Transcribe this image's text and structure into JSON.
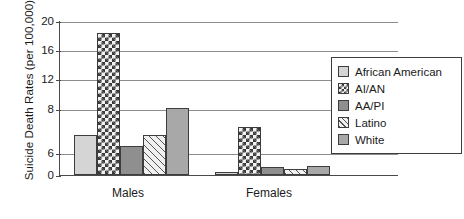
{
  "chart_data": {
    "type": "bar",
    "title": "",
    "xlabel": "",
    "ylabel": "Suicide Death Rates (per 100,000)",
    "categories": [
      "Males",
      "Females"
    ],
    "series": [
      {
        "name": "African American",
        "values": [
          6.8,
          0.8
        ],
        "pattern": "solid-light-gray",
        "color": "#d5d5d5"
      },
      {
        "name": "AI/AN",
        "values": [
          18.4,
          7.2
        ],
        "pattern": "checkerboard",
        "color": "#3a3a3a"
      },
      {
        "name": "AA/PI",
        "values": [
          6.3,
          2.2
        ],
        "pattern": "solid-dark-gray",
        "color": "#8f8f8f"
      },
      {
        "name": "Latino",
        "values": [
          6.8,
          1.6
        ],
        "pattern": "diagonal-hatch",
        "color": "#f0f0f0"
      },
      {
        "name": "White",
        "values": [
          8.2,
          2.4
        ],
        "pattern": "solid-mid-gray",
        "color": "#a8a8a8"
      }
    ],
    "yticks": [
      0,
      6,
      8,
      12,
      16,
      20
    ],
    "ylim": [
      0,
      20
    ],
    "grid": true,
    "legend_position": "right",
    "axis_color": "#4a4a4a",
    "grid_color": "#8c8c8c"
  },
  "legend": {
    "items": [
      {
        "label": "African American"
      },
      {
        "label": "AI/AN"
      },
      {
        "label": "AA/PI"
      },
      {
        "label": "Latino"
      },
      {
        "label": "White"
      }
    ]
  }
}
